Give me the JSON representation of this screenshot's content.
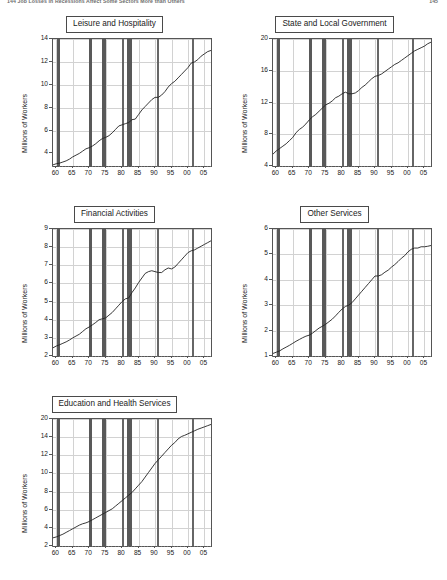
{
  "header": {
    "left": "144   Job Losses in Recessions Affect Some Sectors More than Others",
    "right": "145"
  },
  "axis": {
    "ylabel": "Millions of Workers",
    "xticks": [
      "60",
      "65",
      "70",
      "75",
      "80",
      "85",
      "90",
      "95",
      "00",
      "05"
    ]
  },
  "recessions": [
    {
      "start": 1960.3,
      "end": 1961.1,
      "label": "1960-61"
    },
    {
      "start": 1969.9,
      "end": 1970.9,
      "label": "1969-70"
    },
    {
      "start": 1973.9,
      "end": 1975.2,
      "label": "1973-75"
    },
    {
      "start": 1980.1,
      "end": 1980.5,
      "label": "1980"
    },
    {
      "start": 1981.6,
      "end": 1982.9,
      "label": "1981-82"
    },
    {
      "start": 1990.6,
      "end": 1991.2,
      "label": "1990-91"
    },
    {
      "start": 2001.2,
      "end": 2001.9,
      "label": "2001"
    }
  ],
  "chart_data": [
    {
      "type": "line",
      "title": "Leisure and Hospitality",
      "xlabel": "",
      "ylabel": "Millions of Workers",
      "xlim": [
        1959,
        2007
      ],
      "ylim": [
        2.9,
        14
      ],
      "yticks": [
        4,
        6,
        8,
        10,
        12,
        14
      ],
      "ytick_labels": [
        "4",
        "6",
        "8",
        "10",
        "12",
        "14"
      ],
      "grid": true,
      "legend": "none",
      "x": [
        1959,
        1960,
        1961,
        1962,
        1963,
        1964,
        1965,
        1966,
        1967,
        1968,
        1969,
        1970,
        1971,
        1972,
        1973,
        1974,
        1975,
        1976,
        1977,
        1978,
        1979,
        1980,
        1981,
        1982,
        1983,
        1984,
        1985,
        1986,
        1987,
        1988,
        1989,
        1990,
        1991,
        1992,
        1993,
        1994,
        1995,
        1996,
        1997,
        1998,
        1999,
        2000,
        2001,
        2002,
        2003,
        2004,
        2005,
        2006,
        2007
      ],
      "values": [
        3.0,
        3.1,
        3.15,
        3.25,
        3.35,
        3.5,
        3.7,
        3.85,
        4.0,
        4.2,
        4.4,
        4.5,
        4.65,
        4.85,
        5.1,
        5.3,
        5.4,
        5.55,
        5.8,
        6.1,
        6.4,
        6.5,
        6.6,
        6.7,
        6.95,
        7.0,
        7.4,
        7.8,
        8.1,
        8.4,
        8.7,
        8.9,
        8.9,
        9.1,
        9.4,
        9.8,
        10.1,
        10.3,
        10.6,
        10.9,
        11.2,
        11.5,
        11.9,
        12.0,
        12.2,
        12.5,
        12.7,
        12.9,
        13.0
      ]
    },
    {
      "type": "line",
      "title": "State and Local Government",
      "xlabel": "",
      "ylabel": "Millions of Workers",
      "xlim": [
        1959,
        2007
      ],
      "ylim": [
        4,
        20
      ],
      "yticks": [
        4,
        8,
        12,
        16,
        20
      ],
      "ytick_labels": [
        "4",
        "8",
        "12",
        "16",
        "20"
      ],
      "grid": true,
      "legend": "none",
      "x": [
        1959,
        1960,
        1961,
        1962,
        1963,
        1964,
        1965,
        1966,
        1967,
        1968,
        1969,
        1970,
        1971,
        1972,
        1973,
        1974,
        1975,
        1976,
        1977,
        1978,
        1979,
        1980,
        1981,
        1982,
        1983,
        1984,
        1985,
        1986,
        1987,
        1988,
        1989,
        1990,
        1991,
        1992,
        1993,
        1994,
        1995,
        1996,
        1997,
        1998,
        1999,
        2000,
        2001,
        2002,
        2003,
        2004,
        2005,
        2006,
        2007
      ],
      "values": [
        5.5,
        5.9,
        6.2,
        6.5,
        6.8,
        7.2,
        7.6,
        8.2,
        8.6,
        8.9,
        9.3,
        9.8,
        10.2,
        10.5,
        10.9,
        11.3,
        11.7,
        11.9,
        12.2,
        12.6,
        12.8,
        13.1,
        13.3,
        13.1,
        13.1,
        13.2,
        13.5,
        13.9,
        14.2,
        14.6,
        15.0,
        15.3,
        15.4,
        15.6,
        15.9,
        16.2,
        16.5,
        16.8,
        17.0,
        17.3,
        17.6,
        17.9,
        18.2,
        18.5,
        18.7,
        18.9,
        19.1,
        19.4,
        19.6
      ]
    },
    {
      "type": "line",
      "title": "Financial Activities",
      "xlabel": "",
      "ylabel": "Millions of Workers",
      "xlim": [
        1959,
        2007
      ],
      "ylim": [
        2,
        9
      ],
      "yticks": [
        2,
        3,
        4,
        5,
        6,
        7,
        8,
        9
      ],
      "ytick_labels": [
        "2",
        "3",
        "4",
        "5",
        "6",
        "7",
        "8",
        "9"
      ],
      "grid": true,
      "legend": "none",
      "x": [
        1959,
        1960,
        1961,
        1962,
        1963,
        1964,
        1965,
        1966,
        1967,
        1968,
        1969,
        1970,
        1971,
        1972,
        1973,
        1974,
        1975,
        1976,
        1977,
        1978,
        1979,
        1980,
        1981,
        1982,
        1983,
        1984,
        1985,
        1986,
        1987,
        1988,
        1989,
        1990,
        1991,
        1992,
        1993,
        1994,
        1995,
        1996,
        1997,
        1998,
        1999,
        2000,
        2001,
        2002,
        2003,
        2004,
        2005,
        2006,
        2007
      ],
      "values": [
        2.45,
        2.55,
        2.62,
        2.7,
        2.78,
        2.88,
        3.0,
        3.1,
        3.2,
        3.35,
        3.5,
        3.6,
        3.72,
        3.85,
        4.0,
        4.05,
        4.1,
        4.25,
        4.4,
        4.6,
        4.8,
        5.0,
        5.15,
        5.2,
        5.5,
        5.75,
        6.05,
        6.3,
        6.55,
        6.65,
        6.7,
        6.65,
        6.6,
        6.6,
        6.75,
        6.85,
        6.8,
        6.9,
        7.1,
        7.3,
        7.5,
        7.7,
        7.8,
        7.85,
        7.95,
        8.05,
        8.15,
        8.25,
        8.35
      ]
    },
    {
      "type": "line",
      "title": "Other Services",
      "xlabel": "",
      "ylabel": "Millions of Workers",
      "xlim": [
        1959,
        2007
      ],
      "ylim": [
        1,
        6
      ],
      "yticks": [
        1,
        2,
        3,
        4,
        5,
        6
      ],
      "ytick_labels": [
        "1",
        "2",
        "3",
        "4",
        "5",
        "6"
      ],
      "grid": true,
      "legend": "none",
      "x": [
        1959,
        1960,
        1961,
        1962,
        1963,
        1964,
        1965,
        1966,
        1967,
        1968,
        1969,
        1970,
        1971,
        1972,
        1973,
        1974,
        1975,
        1976,
        1977,
        1978,
        1979,
        1980,
        1981,
        1982,
        1983,
        1984,
        1985,
        1986,
        1987,
        1988,
        1989,
        1990,
        1991,
        1992,
        1993,
        1994,
        1995,
        1996,
        1997,
        1998,
        1999,
        2000,
        2001,
        2002,
        2003,
        2004,
        2005,
        2006,
        2007
      ],
      "values": [
        1.1,
        1.15,
        1.2,
        1.28,
        1.35,
        1.42,
        1.5,
        1.58,
        1.65,
        1.72,
        1.78,
        1.82,
        1.9,
        2.0,
        2.1,
        2.17,
        2.25,
        2.35,
        2.45,
        2.58,
        2.72,
        2.85,
        2.95,
        3.0,
        3.1,
        3.25,
        3.4,
        3.55,
        3.7,
        3.85,
        4.0,
        4.15,
        4.15,
        4.2,
        4.3,
        4.38,
        4.5,
        4.6,
        4.72,
        4.85,
        4.95,
        5.1,
        5.2,
        5.25,
        5.25,
        5.3,
        5.3,
        5.32,
        5.35
      ]
    },
    {
      "type": "line",
      "title": "Education and Health Services",
      "xlabel": "",
      "ylabel": "Millions of Workers",
      "xlim": [
        1959,
        2007
      ],
      "ylim": [
        2,
        20
      ],
      "yticks": [
        2,
        4,
        6,
        8,
        10,
        12,
        14,
        20
      ],
      "ytick_labels": [
        "2",
        "4",
        "6",
        "8",
        "10",
        "12",
        "14",
        "20"
      ],
      "grid": true,
      "legend": "none",
      "x": [
        1959,
        1960,
        1961,
        1962,
        1963,
        1964,
        1965,
        1966,
        1967,
        1968,
        1969,
        1970,
        1971,
        1972,
        1973,
        1974,
        1975,
        1976,
        1977,
        1978,
        1979,
        1980,
        1981,
        1982,
        1983,
        1984,
        1985,
        1986,
        1987,
        1988,
        1989,
        1990,
        1991,
        1992,
        1993,
        1994,
        1995,
        1996,
        1997,
        1998,
        1999,
        2000,
        2001,
        2002,
        2003,
        2004,
        2005,
        2006,
        2007
      ],
      "values": [
        2.9,
        3.0,
        3.15,
        3.3,
        3.5,
        3.7,
        3.9,
        4.1,
        4.3,
        4.45,
        4.55,
        4.7,
        4.9,
        5.1,
        5.3,
        5.5,
        5.7,
        5.9,
        6.1,
        6.4,
        6.7,
        7.0,
        7.3,
        7.6,
        7.9,
        8.3,
        8.7,
        9.1,
        9.6,
        10.1,
        10.6,
        11.1,
        11.5,
        11.9,
        12.3,
        12.7,
        13.1,
        13.4,
        13.8,
        14.2,
        14.6,
        15.1,
        15.6,
        16.1,
        16.6,
        17.0,
        17.4,
        17.8,
        18.2
      ]
    }
  ]
}
